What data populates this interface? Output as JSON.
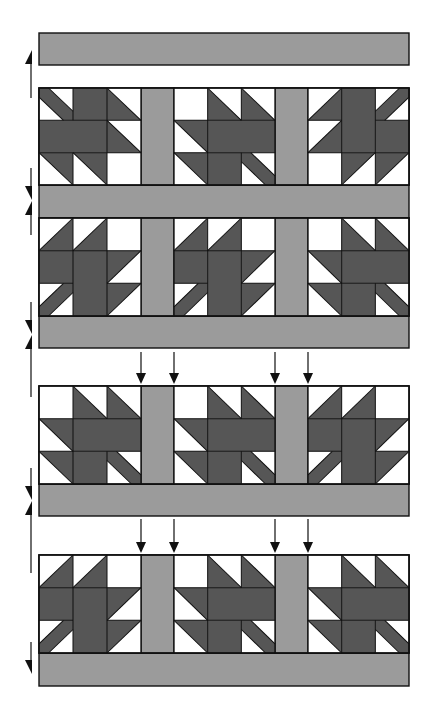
{
  "diagram": {
    "colors": {
      "background": "#ffffff",
      "sashing": "#9b9b9b",
      "leaf": "#565656",
      "outline": "#111111",
      "arrow": "#111111"
    },
    "layout": {
      "quilt_left": 39,
      "quilt_right": 409,
      "block_columns": [
        [
          39,
          141
        ],
        [
          174,
          275
        ],
        [
          308,
          409
        ]
      ],
      "vertical_sashing_columns": [
        [
          141,
          174
        ],
        [
          275,
          308
        ]
      ]
    },
    "horizontal_sashing": [
      {
        "label": "top sashing strip",
        "y": 33,
        "h": 32
      },
      {
        "label": "sashing strip 2",
        "y": 185,
        "h": 33
      },
      {
        "label": "sashing strip 3",
        "y": 316,
        "h": 32
      },
      {
        "label": "sashing strip 4",
        "y": 484,
        "h": 32
      },
      {
        "label": "bottom sashing strip",
        "y": 653,
        "h": 33
      }
    ],
    "block_rows": [
      {
        "label": "block row 1",
        "y": 88,
        "h": 97,
        "rotations": [
          0,
          180,
          90
        ]
      },
      {
        "label": "block row 2",
        "y": 218,
        "h": 98,
        "rotations": [
          270,
          270,
          180
        ]
      },
      {
        "label": "block row 3",
        "y": 386,
        "h": 98,
        "rotations": [
          180,
          180,
          270
        ]
      },
      {
        "label": "block row 4",
        "y": 555,
        "h": 98,
        "rotations": [
          270,
          180,
          180
        ]
      }
    ],
    "side_arrows": [
      {
        "direction": "up",
        "x": 31,
        "tip": 50,
        "tail": 98
      },
      {
        "direction": "down",
        "x": 31,
        "tip": 200,
        "tail": 168
      },
      {
        "direction": "up",
        "x": 31,
        "tip": 201,
        "tail": 235
      },
      {
        "direction": "down",
        "x": 31,
        "tip": 334,
        "tail": 302
      },
      {
        "direction": "up",
        "x": 31,
        "tip": 335,
        "tail": 397
      },
      {
        "direction": "down",
        "x": 31,
        "tip": 500,
        "tail": 468
      },
      {
        "direction": "up",
        "x": 31,
        "tip": 501,
        "tail": 573
      },
      {
        "direction": "down",
        "x": 31,
        "tip": 674,
        "tail": 642
      }
    ],
    "placement_arrows": [
      {
        "group": "above block row 3",
        "xs": [
          141,
          174,
          275,
          308
        ],
        "tail": 352,
        "tip": 384
      },
      {
        "group": "above block row 4",
        "xs": [
          141,
          174,
          275,
          308
        ],
        "tail": 519,
        "tip": 553
      }
    ]
  }
}
